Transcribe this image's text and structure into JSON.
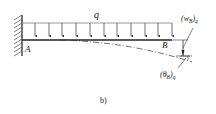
{
  "diagram": {
    "caption": "b)",
    "load_label": "q",
    "point_a_label": "A",
    "point_b_label": "B",
    "deflection_label": {
      "main": "(w",
      "sub": "B",
      "close": ")",
      "subscript2": "q"
    },
    "rotation_label": {
      "main": "(θ",
      "sub": "B",
      "close": ")",
      "subscript2": "q"
    },
    "load_arrow_count": 11,
    "colors": {
      "line": "#222222",
      "background": "#ffffff"
    }
  }
}
